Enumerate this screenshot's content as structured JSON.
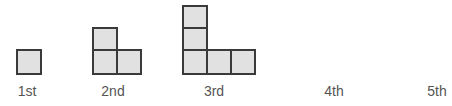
{
  "colors": {
    "fill": "#e1e1e1",
    "border": "#3a3a3a",
    "label": "#555555"
  },
  "figures": [
    {
      "label": "1st",
      "squares": 1
    },
    {
      "label": "2nd",
      "squares": 3
    },
    {
      "label": "3rd",
      "squares": 5
    },
    {
      "label": "4th",
      "squares": null
    },
    {
      "label": "5th",
      "squares": null
    }
  ]
}
